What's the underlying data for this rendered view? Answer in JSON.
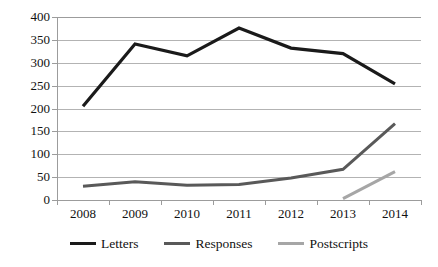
{
  "chart_data": {
    "type": "line",
    "title": "",
    "xlabel": "",
    "ylabel": "",
    "categories": [
      "2008",
      "2009",
      "2010",
      "2011",
      "2012",
      "2013",
      "2014"
    ],
    "ylim": [
      0,
      400
    ],
    "ytick_step": 50,
    "yticks": [
      "0",
      "50",
      "100",
      "150",
      "200",
      "250",
      "300",
      "350",
      "400"
    ],
    "grid": "horizontal",
    "legend_position": "bottom",
    "series": [
      {
        "name": "Letters",
        "color": "#1a1a1a",
        "width": 3.2,
        "values": [
          205,
          341,
          315,
          376,
          332,
          320,
          254
        ]
      },
      {
        "name": "Responses",
        "color": "#595959",
        "width": 3.0,
        "values": [
          30,
          40,
          32,
          34,
          48,
          67,
          167
        ]
      },
      {
        "name": "Postscripts",
        "color": "#a6a6a6",
        "width": 3.0,
        "values": [
          null,
          null,
          null,
          null,
          null,
          3,
          62
        ]
      }
    ]
  },
  "legend": {
    "items": [
      {
        "label": "Letters",
        "color": "#1a1a1a"
      },
      {
        "label": "Responses",
        "color": "#595959"
      },
      {
        "label": "Postscripts",
        "color": "#a6a6a6"
      }
    ]
  },
  "axes": {
    "gridline_color": "#b3b3b3",
    "axis_color": "#9c9c9c"
  }
}
